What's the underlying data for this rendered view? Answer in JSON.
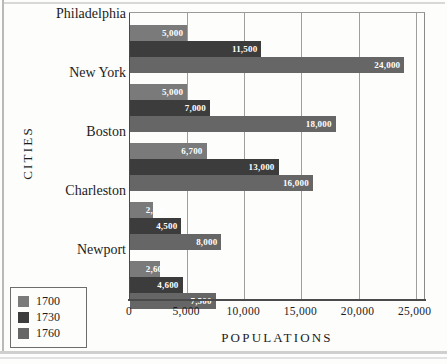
{
  "chart_data": {
    "type": "bar",
    "orientation": "horizontal",
    "title": "",
    "xlabel": "POPULATIONS",
    "ylabel": "CITIES",
    "categories": [
      "Philadelphia",
      "New York",
      "Boston",
      "Charleston",
      "Newport"
    ],
    "series": [
      {
        "name": "1700",
        "color": "#7a7a7a",
        "values": [
          5000,
          5000,
          6700,
          2000,
          2600
        ]
      },
      {
        "name": "1730",
        "color": "#3c3c3c",
        "values": [
          11500,
          7000,
          13000,
          4500,
          4600
        ]
      },
      {
        "name": "1760",
        "color": "#666666",
        "values": [
          24000,
          18000,
          16000,
          8000,
          7500
        ]
      }
    ],
    "value_labels": {
      "Philadelphia": [
        "5,000",
        "11,500",
        "24,000"
      ],
      "New York": [
        "5,000",
        "7,000",
        "18,000"
      ],
      "Boston": [
        "6,700",
        "13,000",
        "16,000"
      ],
      "Charleston": [
        "2,000",
        "4,500",
        "8,000"
      ],
      "Newport": [
        "2,600",
        "4,600",
        "7,500"
      ]
    },
    "xlim": [
      0,
      25900
    ],
    "xticks": [
      0,
      5000,
      10000,
      15000,
      20000,
      25000
    ],
    "xtick_labels": [
      "0",
      "5,000",
      "10,000",
      "15,000",
      "20,000",
      "25,000"
    ],
    "grid": "vertical",
    "legend_position": "bottom-left",
    "legend_entries": [
      "1700",
      "1730",
      "1760"
    ]
  },
  "axis": {
    "x_title": "POPULATIONS",
    "y_title": "CITIES"
  }
}
